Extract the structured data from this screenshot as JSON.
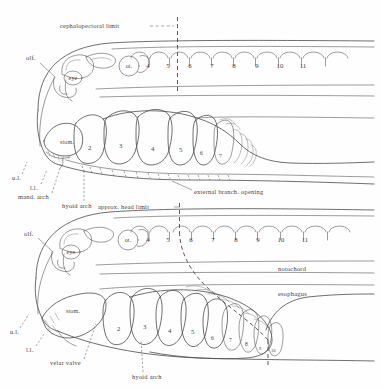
{
  "figure": {
    "kind": "comparative-anatomy-line-drawing",
    "panels": [
      {
        "id": "upper",
        "name": "upper-embryo-diagram",
        "limit_label": "cephalopectoral  limit",
        "somite_numbers": [
          "4",
          "5",
          "6",
          "7",
          "8",
          "9",
          "10",
          "11"
        ],
        "gill_arch_numbers": [
          "2",
          "3",
          "4",
          "5",
          "6",
          "7"
        ],
        "structures": [
          {
            "key": "olf",
            "label": "olf."
          },
          {
            "key": "eye",
            "label": "eye"
          },
          {
            "key": "ot",
            "label": "ot."
          },
          {
            "key": "stom",
            "label": "stom."
          },
          {
            "key": "ul",
            "label": "u.l."
          },
          {
            "key": "ll",
            "label": "l.l."
          }
        ],
        "callouts": [
          {
            "key": "mand-arch",
            "label": "mand. arch"
          },
          {
            "key": "hyoid-arch",
            "label": "hyoid arch"
          },
          {
            "key": "ext-branch-opening",
            "label": "external  branch. opening"
          }
        ]
      },
      {
        "id": "lower",
        "name": "lower-embryo-diagram",
        "limit_label": "approx. head limit",
        "somite_numbers": [
          "4",
          "5",
          "6",
          "7",
          "8",
          "9",
          "10",
          "11"
        ],
        "gill_arch_numbers": [
          "2",
          "3",
          "4",
          "5",
          "6",
          "7",
          "8",
          "9",
          "10"
        ],
        "structures": [
          {
            "key": "olf",
            "label": "olf."
          },
          {
            "key": "eye",
            "label": "eye"
          },
          {
            "key": "ot",
            "label": "ot."
          },
          {
            "key": "stom",
            "label": "stom."
          },
          {
            "key": "ul",
            "label": "u.l."
          },
          {
            "key": "ll",
            "label": "l.l."
          }
        ],
        "callouts": [
          {
            "key": "notochord",
            "label": "notochord"
          },
          {
            "key": "esophagus",
            "label": "esophagus"
          },
          {
            "key": "velar-valve",
            "label": "velar valve"
          },
          {
            "key": "hyoid-arch",
            "label": "hyoid arch"
          }
        ]
      }
    ],
    "colors": {
      "paper": "#fefefe",
      "ink": "#4a4a4a",
      "ink_light": "#8a8a8a",
      "text": "#3f3f3f"
    }
  }
}
